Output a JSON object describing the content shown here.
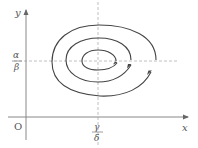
{
  "diagram": {
    "type": "phase-portrait",
    "axes": {
      "x_label": "x",
      "y_label": "y",
      "origin_label": "O"
    },
    "equilibrium": {
      "x_numerator": "γ",
      "x_denominator": "δ",
      "y_numerator": "α",
      "y_denominator": "β"
    },
    "trajectory": "outward spiral around equilibrium with direction arrows",
    "colors": {
      "axis": "#888888",
      "curve": "#444444",
      "dashed": "#aaaaaa",
      "text": "#555555"
    }
  }
}
